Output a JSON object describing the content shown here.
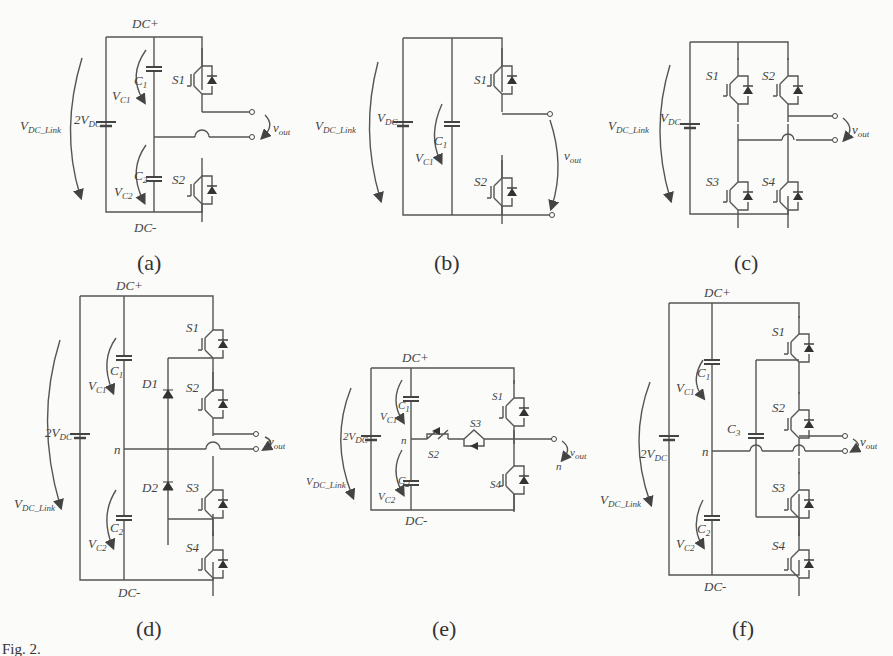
{
  "figure": {
    "caption_prefix": "Fig. 2.",
    "panels": [
      {
        "id": "a",
        "caption": "(a)",
        "dc_plus": "DC+",
        "dc_minus": "DC-",
        "source": "2V",
        "source_sub": "DC",
        "link": "V",
        "link_sub": "DC_Link",
        "caps": [
          {
            "name": "C",
            "sub": "1",
            "v": "V",
            "vsub": "C1"
          },
          {
            "name": "C",
            "sub": "2",
            "v": "V",
            "vsub": "C2"
          }
        ],
        "switches": [
          "S1",
          "S2"
        ],
        "vout": "v",
        "vout_sub": "out"
      },
      {
        "id": "b",
        "caption": "(b)",
        "source": "V",
        "source_sub": "DC",
        "link": "V",
        "link_sub": "DC_Link",
        "caps": [
          {
            "name": "C",
            "sub": "1",
            "v": "V",
            "vsub": "C1"
          }
        ],
        "switches": [
          "S1",
          "S2"
        ],
        "vout": "v",
        "vout_sub": "out"
      },
      {
        "id": "c",
        "caption": "(c)",
        "source": "V",
        "source_sub": "DC",
        "link": "V",
        "link_sub": "DC_Link",
        "switches": [
          "S1",
          "S2",
          "S3",
          "S4"
        ],
        "vout": "v",
        "vout_sub": "out"
      },
      {
        "id": "d",
        "caption": "(d)",
        "dc_plus": "DC+",
        "dc_minus": "DC-",
        "source": "2V",
        "source_sub": "DC",
        "link": "V",
        "link_sub": "DC_Link",
        "node": "n",
        "caps": [
          {
            "name": "C",
            "sub": "1",
            "v": "V",
            "vsub": "C1"
          },
          {
            "name": "C",
            "sub": "2",
            "v": "V",
            "vsub": "C2"
          }
        ],
        "diodes": [
          "D1",
          "D2"
        ],
        "switches": [
          "S1",
          "S2",
          "S3",
          "S4"
        ],
        "vout": "v",
        "vout_sub": "out"
      },
      {
        "id": "e",
        "caption": "(e)",
        "dc_plus": "DC+",
        "dc_minus": "DC-",
        "source": "2V",
        "source_sub": "DC",
        "link": "V",
        "link_sub": "DC_Link",
        "node": "n",
        "out_node": "n",
        "caps": [
          {
            "name": "C",
            "sub": "1",
            "v": "V",
            "vsub": "C1"
          },
          {
            "name": "C",
            "sub": "2",
            "v": "V",
            "vsub": "C2"
          }
        ],
        "switches": [
          "S1",
          "S2",
          "S3",
          "S4"
        ],
        "vout": "v",
        "vout_sub": "out"
      },
      {
        "id": "f",
        "caption": "(f)",
        "dc_plus": "DC+",
        "dc_minus": "DC-",
        "source": "2V",
        "source_sub": "DC",
        "link": "V",
        "link_sub": "DC_Link",
        "node": "n",
        "caps": [
          {
            "name": "C",
            "sub": "1",
            "v": "V",
            "vsub": "C1"
          },
          {
            "name": "C",
            "sub": "2",
            "v": "V",
            "vsub": "C2"
          },
          {
            "name": "C",
            "sub": "3"
          }
        ],
        "switches": [
          "S1",
          "S2",
          "S3",
          "S4"
        ],
        "vout": "v",
        "vout_sub": "out"
      }
    ]
  }
}
